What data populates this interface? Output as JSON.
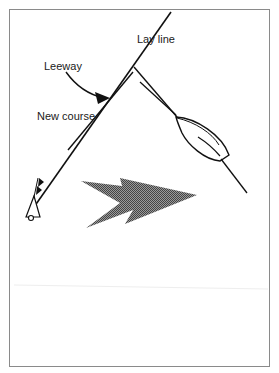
{
  "diagram": {
    "labels": {
      "lay_line": "Lay line",
      "leeway": "Leeway",
      "new_course": "New course"
    },
    "elements": {
      "wind_arrow": "wind-direction-arrow",
      "boat": "sailboat-hull",
      "mark": "buoy-mark"
    },
    "colors": {
      "line": "#111111",
      "frame": "#8a8a8a",
      "wind_fill": "#6e6e6e",
      "background": "#ffffff"
    }
  }
}
